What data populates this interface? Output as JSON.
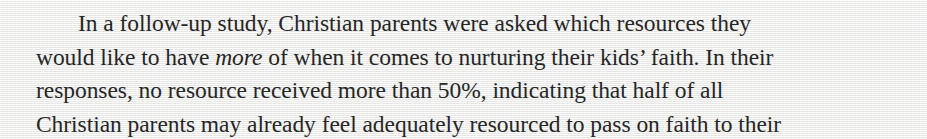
{
  "document": {
    "type": "scanned-book-page-excerpt",
    "background_color": "#f2f2f0",
    "text_color": "#262626"
  },
  "paragraph": {
    "lines": [
      {
        "id": "line-1",
        "indented": true,
        "segments": [
          {
            "text": "In a follow-up study, Christian parents were asked which resources they",
            "style": "normal"
          }
        ]
      },
      {
        "id": "line-2",
        "indented": false,
        "segments": [
          {
            "text": "would like to have ",
            "style": "normal"
          },
          {
            "text": "more",
            "style": "italic"
          },
          {
            "text": " of when it comes to nurturing their kids’ faith. In their",
            "style": "normal"
          }
        ]
      },
      {
        "id": "line-3",
        "indented": false,
        "segments": [
          {
            "text": "responses, no resource received more than 50%, indicating that half of all",
            "style": "normal"
          }
        ]
      },
      {
        "id": "line-4",
        "indented": false,
        "segments": [
          {
            "text": "Christian parents may already feel adequately resourced to pass on faith to their",
            "style": "normal"
          }
        ]
      }
    ]
  }
}
